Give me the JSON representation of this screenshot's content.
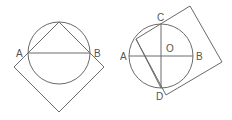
{
  "figures": [
    {
      "id": "left",
      "labels": {
        "A": "A",
        "B": "B"
      }
    },
    {
      "id": "right",
      "labels": {
        "A": "A",
        "B": "B",
        "C": "C",
        "D": "D",
        "O": "O"
      }
    }
  ],
  "colors": {
    "stroke": "#6a6a6a",
    "text": "#555555",
    "background": "#ffffff"
  }
}
